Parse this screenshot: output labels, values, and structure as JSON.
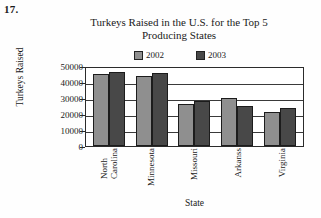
{
  "problem_number": "17.",
  "chart_data": {
    "type": "bar",
    "title": "Turkeys Raised in the U.S. for the Top 5 Producing States",
    "title_lines": [
      "Turkeys Raised in the U.S. for the Top 5",
      "Producing States"
    ],
    "xlabel": "State",
    "ylabel": "Turkeys Raised",
    "categories": [
      "North Carolina",
      "Minnesota",
      "Missouri",
      "Arkanss",
      "Virginia"
    ],
    "category_lines": [
      [
        "North",
        "Carolina"
      ],
      [
        "Minnesota"
      ],
      [
        "Missouri"
      ],
      [
        "Arkanss"
      ],
      [
        "Virginia"
      ]
    ],
    "series": [
      {
        "name": "2002",
        "color": "#8f8f8f",
        "values": [
          45000,
          44000,
          26000,
          30000,
          21000
        ]
      },
      {
        "name": "2003",
        "color": "#484848",
        "values": [
          46000,
          45500,
          28000,
          25000,
          24000
        ]
      }
    ],
    "ylim": [
      0,
      50000
    ],
    "yticks": [
      0,
      10000,
      20000,
      30000,
      40000,
      50000
    ],
    "ytick_labels": [
      "0",
      "10000",
      "20000",
      "30000",
      "40000",
      "50000"
    ],
    "grid": true,
    "legend_position": "top"
  }
}
